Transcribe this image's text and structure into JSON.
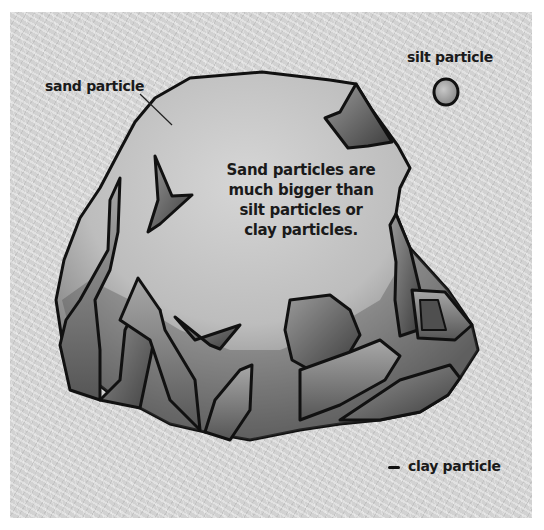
{
  "diagram": {
    "labels": {
      "sand": "sand particle",
      "silt": "silt particle",
      "clay": "clay particle"
    },
    "caption_lines": [
      "Sand particles are",
      "much bigger than",
      "silt particles or",
      "clay particles."
    ],
    "colors": {
      "background_texture": "#d2d2d2",
      "outline": "#111111",
      "text": "#1a1a1a"
    }
  }
}
